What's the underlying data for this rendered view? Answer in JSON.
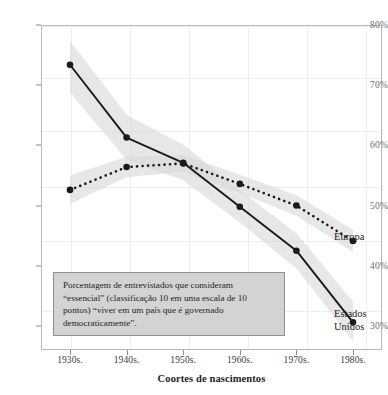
{
  "chart_data": {
    "type": "line",
    "title": "",
    "xlabel": "Coortes de nascimentos",
    "ylabel": "",
    "categories": [
      "1930s.",
      "1940s.",
      "1950s.",
      "1960s.",
      "1970s.",
      "1980s."
    ],
    "ylim": [
      26,
      80
    ],
    "xlim": [
      0,
      5
    ],
    "grid": true,
    "legend_position": "right-inline",
    "ytick_labels": [
      "80%",
      "70%",
      "60%",
      "50%",
      "40%",
      "30%"
    ],
    "ytick_values": [
      80,
      70,
      60,
      50,
      40,
      30
    ],
    "series": [
      {
        "name": "Estados Unidos",
        "style": "solid",
        "color": "#1a1a1a",
        "values": [
          73.4,
          61.3,
          57.1,
          49.8,
          42.5,
          30.6
        ],
        "band_low": [
          68.8,
          57.6,
          54.2,
          47.2,
          39.6,
          27.5
        ],
        "band_high": [
          77.4,
          65.1,
          60.1,
          52.6,
          45.4,
          34.0
        ]
      },
      {
        "name": "Europa",
        "style": "dotted",
        "color": "#1a1a1a",
        "values": [
          52.6,
          56.4,
          57.0,
          53.6,
          50.0,
          44.1
        ],
        "band_low": [
          50.3,
          54.7,
          55.6,
          52.1,
          48.3,
          42.3
        ],
        "band_high": [
          55.0,
          58.1,
          58.4,
          55.1,
          51.7,
          46.0
        ]
      }
    ],
    "annotation": "Porcentagem de entrevistados que consideram “essencial” (classificação 10 em uma escala de 10 pontos) “viver em um país que é governado democraticamente”.",
    "series_labels": {
      "europa": "Europa",
      "estados_unidos": "Estados\nUnidos"
    },
    "colors": {
      "line": "#1a1a1a",
      "band": "#d9d9d9",
      "grid": "#ededed",
      "frame": "#b9b9b9",
      "annotation_bg": "#d3d3d3",
      "annotation_border": "#8f8f8f",
      "tick_text": "#6d6d6d"
    }
  }
}
